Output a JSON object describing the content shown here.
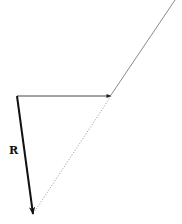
{
  "diagram": {
    "type": "vector-diagram",
    "labels": {
      "resultant": "R"
    },
    "colors": {
      "resultant_arrow": "#111111",
      "horizontal_arrow": "#333333",
      "incoming_line": "#8a8a8a",
      "dotted_line": "#9a9a9a",
      "background": "#ffffff"
    },
    "elements": [
      {
        "name": "incoming-line",
        "from": [
          175,
          0
        ],
        "to": [
          111,
          95
        ],
        "style": "solid-thin-grey"
      },
      {
        "name": "horizontal-arrow",
        "from": [
          17,
          96
        ],
        "to": [
          111,
          96
        ],
        "style": "solid-thin-arrow"
      },
      {
        "name": "resultant-arrow",
        "from": [
          17,
          96
        ],
        "to": [
          33,
          214
        ],
        "style": "solid-thick-arrow",
        "label": "R"
      },
      {
        "name": "dotted-line",
        "from": [
          111,
          96
        ],
        "to": [
          35,
          211
        ],
        "style": "dotted"
      }
    ]
  }
}
